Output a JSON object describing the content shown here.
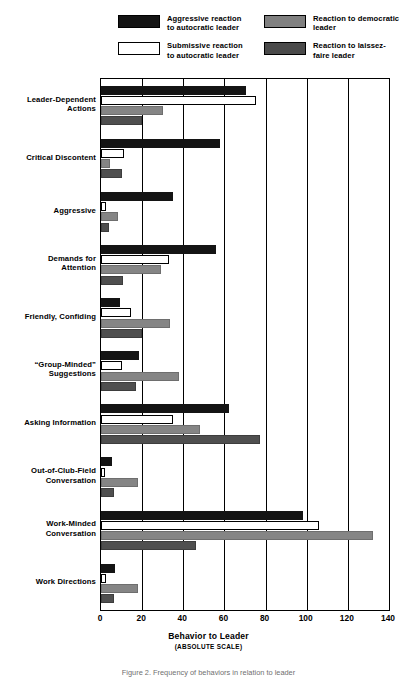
{
  "legend": {
    "entries": [
      {
        "id": "aggressive-autocratic",
        "label": "Aggressive reaction\nto autocratic leader",
        "swatch": "black",
        "color": "#141414"
      },
      {
        "id": "submissive-autocratic",
        "label": "Submissive reaction\nto autocratic leader",
        "swatch": "white",
        "color": "#ffffff"
      },
      {
        "id": "democratic",
        "label": "Reaction to democratic\nleader",
        "swatch": "mid-gray",
        "color": "#858585"
      },
      {
        "id": "laissez-faire",
        "label": "Reaction to laissez-\nfaire leader",
        "swatch": "dark-gray",
        "color": "#4f4f4f"
      }
    ]
  },
  "axis": {
    "title": "Behavior to Leader",
    "subtitle": "(ABSOLUTE SCALE)",
    "ticks": [
      "0",
      "20",
      "40",
      "60",
      "80",
      "100",
      "120",
      "140"
    ]
  },
  "caption": "Figure 2.  Frequency of behaviors in relation to leader",
  "chart_data": {
    "type": "bar",
    "orientation": "horizontal",
    "title": "",
    "xlabel": "Behavior to Leader",
    "ylabel": "",
    "xlim": [
      0,
      140
    ],
    "xticks": [
      0,
      20,
      40,
      60,
      80,
      100,
      120,
      140
    ],
    "grid": true,
    "legend_position": "top",
    "categories": [
      "Leader-Dependent\nActions",
      "Critical Discontent",
      "Aggressive",
      "Demands for\nAttention",
      "Friendly, Confiding",
      "“Group-Minded”\nSuggestions",
      "Asking Information",
      "Out-of-Club-Field\nConversation",
      "Work-Minded\nConversation",
      "Work Directions"
    ],
    "series": [
      {
        "name": "Aggressive reaction to autocratic leader",
        "color": "#141414",
        "values": [
          70.5,
          58,
          35,
          56,
          9,
          18.5,
          62,
          5.5,
          98,
          7
        ]
      },
      {
        "name": "Submissive reaction to autocratic leader",
        "color": "#ffffff",
        "values": [
          75.5,
          11,
          2.5,
          33,
          14.5,
          10,
          35,
          2,
          106,
          2.5
        ]
      },
      {
        "name": "Reaction to democratic leader",
        "color": "#858585",
        "values": [
          30,
          4.5,
          8.5,
          29,
          33.5,
          38,
          48,
          18,
          132,
          18
        ]
      },
      {
        "name": "Reaction to laissez-faire leader",
        "color": "#4f4f4f",
        "values": [
          20,
          10,
          4,
          10.5,
          20,
          17,
          77.5,
          6.5,
          46,
          6.5
        ]
      }
    ]
  }
}
